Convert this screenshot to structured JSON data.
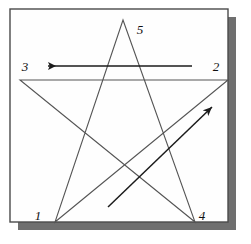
{
  "figure": {
    "name": "pentagram-stroke-order-diagram",
    "background_color": "#ffffff",
    "stroke_color": "#555555",
    "label_color": "#101010",
    "frame": {
      "border_color": "#4a4a4a",
      "fill_color": "#fefefe",
      "x": 10,
      "y": 9,
      "width": 218,
      "height": 213,
      "border_width": 1.4
    },
    "shadow": {
      "color": "#6f6f6f",
      "offset_x": 8,
      "offset_y": 8
    },
    "vertices": [
      {
        "label": "1",
        "point_x": 55,
        "point_y": 222,
        "label_x": 38,
        "label_y": 220
      },
      {
        "label": "2",
        "point_x": 228,
        "point_y": 80,
        "label_x": 216,
        "label_y": 71
      },
      {
        "label": "3",
        "point_x": 20,
        "point_y": 80,
        "label_x": 25,
        "label_y": 71
      },
      {
        "label": "4",
        "point_x": 195,
        "point_y": 222,
        "label_x": 202,
        "label_y": 220
      },
      {
        "label": "5",
        "point_x": 123,
        "point_y": 20,
        "label_x": 140,
        "label_y": 34
      }
    ],
    "star_path": "M 55 222 L 228 80 L 20 80 L 195 222 L 123 20 Z",
    "star_stroke_width": 1.1,
    "arrows": [
      {
        "name": "horizontal-direction-arrow",
        "direction": "left",
        "tail_x": 192,
        "tail_y": 66,
        "tip_x": 48,
        "tip_y": 66,
        "stroke_width": 1.5
      },
      {
        "name": "diagonal-direction-arrow",
        "direction": "up-right",
        "tail_x": 108,
        "tail_y": 207,
        "tip_x": 212,
        "tip_y": 107,
        "stroke_width": 1.5
      }
    ]
  }
}
